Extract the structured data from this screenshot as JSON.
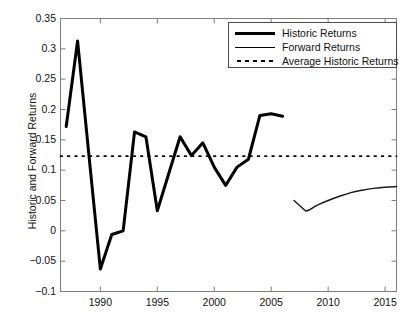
{
  "chart_data": {
    "type": "line",
    "title": "",
    "xlabel": "",
    "ylabel": "Historic and Forward Returns",
    "xlim": [
      1986.5,
      2016.0
    ],
    "ylim": [
      -0.1,
      0.35
    ],
    "xticks": [
      1990,
      1995,
      2000,
      2005,
      2010,
      2015
    ],
    "yticks": [
      -0.1,
      -0.05,
      0,
      0.05,
      0.1,
      0.15,
      0.2,
      0.25,
      0.3,
      0.35
    ],
    "ytick_labels": [
      "-0.1",
      "-0.05",
      "0",
      "0.05",
      "0.1",
      "0.15",
      "0.2",
      "0.25",
      "0.3",
      "0.35"
    ],
    "xtick_labels": [
      "1990",
      "1995",
      "2000",
      "2005",
      "2010",
      "2015"
    ],
    "grid": false,
    "legend_position": "top-right",
    "series": [
      {
        "name": "Historic Returns",
        "style": "thick-solid",
        "color": "#000000",
        "x": [
          1987,
          1988,
          1989,
          1990,
          1991,
          1992,
          1993,
          1994,
          1995,
          1996,
          1997,
          1998,
          1999,
          2000,
          2001,
          2002,
          2003,
          2004,
          2005,
          2006
        ],
        "values": [
          0.172,
          0.313,
          0.124,
          -0.063,
          -0.006,
          0.0,
          0.163,
          0.155,
          0.033,
          0.094,
          0.155,
          0.124,
          0.145,
          0.105,
          0.075,
          0.105,
          0.118,
          0.19,
          0.193,
          0.189
        ]
      },
      {
        "name": "Forward Returns",
        "style": "thin-solid",
        "color": "#1a1a1a",
        "x": [
          2007,
          2008,
          2009,
          2010,
          2011,
          2012,
          2013,
          2014,
          2015,
          2016
        ],
        "values": [
          0.05,
          0.033,
          0.042,
          0.05,
          0.057,
          0.063,
          0.067,
          0.07,
          0.072,
          0.073
        ]
      },
      {
        "name": "Average Historic Returns",
        "style": "dotted",
        "color": "#000000",
        "constant_value": 0.123,
        "x": [
          1986.5,
          2016.0
        ],
        "values": [
          0.123,
          0.123
        ]
      }
    ]
  },
  "legend": {
    "entries": [
      {
        "label": "Historic Returns",
        "sample": "thick-line-sample"
      },
      {
        "label": "Forward Returns",
        "sample": "thin-line-sample"
      },
      {
        "label": "Average Historic Returns",
        "sample": "dotted-line-sample"
      }
    ]
  },
  "axes": {
    "ylabel": "Historic and Forward Returns"
  }
}
